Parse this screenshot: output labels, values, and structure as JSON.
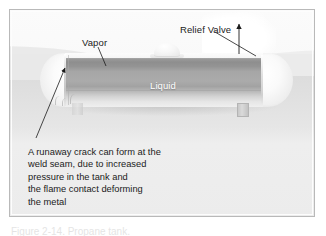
{
  "figure": {
    "type": "technical-illustration",
    "background": {
      "sky_color": "#f9f9f9",
      "ground_color": "#e2e2e2",
      "frame_border_color": "#b9b9b9"
    }
  },
  "labels": {
    "vapor": "Vapor",
    "relief_valve": "Relief Valve",
    "liquid": "Liquid"
  },
  "caption": {
    "lines": [
      "A runaway crack can form at the",
      "weld seam, due to increased",
      "pressure in the tank and",
      "the flame contact deforming",
      "the metal"
    ]
  },
  "undertext": {
    "text": "Figure 2-14. Propane tank."
  },
  "tank": {
    "colors": {
      "shell_light": "#f4f4f4",
      "vapor_band": "#8e8e8e",
      "liquid_band": "#a8a8a8",
      "liquid_text": "#ffffff"
    },
    "parts": [
      {
        "name": "left-end-cap",
        "label": ""
      },
      {
        "name": "right-end-cap",
        "label": ""
      },
      {
        "name": "cylindrical-shell",
        "label": ""
      },
      {
        "name": "weld-seam",
        "label": ""
      },
      {
        "name": "relief-valve-housing",
        "label": ""
      },
      {
        "name": "support-leg",
        "label": ""
      }
    ]
  },
  "annotations": {
    "vent_arrow": {
      "direction": "up",
      "meaning": "vapor venting from relief valve"
    },
    "crack_arrow": {
      "direction": "up-right",
      "meaning": "points to weld seam crack"
    },
    "relief_leader": {
      "direction": "down-right",
      "meaning": "points to relief valve"
    },
    "vapor_leader": {
      "direction": "down-right",
      "meaning": "points to vapor space"
    }
  }
}
